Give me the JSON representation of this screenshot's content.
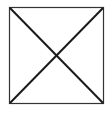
{
  "diagram": {
    "shape": "square-with-diagonals",
    "square": {
      "x": 9,
      "y": 7,
      "width": 94,
      "height": 96
    },
    "colors": {
      "background": "#ffffff",
      "border": "#333333",
      "diagonal": "#1a1a1a"
    },
    "stroke": {
      "border": 1.2,
      "diagonal": 2
    }
  }
}
